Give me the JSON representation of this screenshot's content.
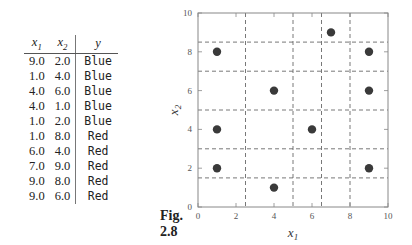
{
  "table": {
    "headers": [
      {
        "base": "x",
        "sub": "1"
      },
      {
        "base": "x",
        "sub": "2"
      },
      {
        "base": "y",
        "sub": ""
      }
    ],
    "rows": [
      [
        "9.0",
        "2.0",
        "Blue"
      ],
      [
        "1.0",
        "4.0",
        "Blue"
      ],
      [
        "4.0",
        "6.0",
        "Blue"
      ],
      [
        "4.0",
        "1.0",
        "Blue"
      ],
      [
        "1.0",
        "2.0",
        "Blue"
      ],
      [
        "1.0",
        "8.0",
        "Red"
      ],
      [
        "6.0",
        "4.0",
        "Red"
      ],
      [
        "7.0",
        "9.0",
        "Red"
      ],
      [
        "9.0",
        "8.0",
        "Red"
      ],
      [
        "9.0",
        "6.0",
        "Red"
      ]
    ]
  },
  "figure": {
    "label_line1": "Fig.",
    "label_line2": "2.8"
  },
  "chart_data": {
    "type": "scatter",
    "title": "",
    "xlabel": "x1",
    "ylabel": "x2",
    "xlim": [
      0,
      10
    ],
    "ylim": [
      0,
      10
    ],
    "x_ticks": [
      0,
      2,
      4,
      6,
      8,
      10
    ],
    "y_ticks": [
      0,
      2,
      4,
      6,
      8,
      10
    ],
    "points": [
      {
        "x": 9,
        "y": 2,
        "class": "Blue"
      },
      {
        "x": 1,
        "y": 4,
        "class": "Blue"
      },
      {
        "x": 4,
        "y": 6,
        "class": "Blue"
      },
      {
        "x": 4,
        "y": 1,
        "class": "Blue"
      },
      {
        "x": 1,
        "y": 2,
        "class": "Blue"
      },
      {
        "x": 1,
        "y": 8,
        "class": "Red"
      },
      {
        "x": 6,
        "y": 4,
        "class": "Red"
      },
      {
        "x": 7,
        "y": 9,
        "class": "Red"
      },
      {
        "x": 9,
        "y": 8,
        "class": "Red"
      },
      {
        "x": 9,
        "y": 6,
        "class": "Red"
      }
    ],
    "vertical_dashed_lines_x": [
      2.5,
      5.0,
      6.5,
      8.0
    ],
    "horizontal_dashed_lines_y": [
      1.5,
      3.0,
      5.0,
      7.0,
      8.5
    ],
    "point_color": "#3a3a3a",
    "grid": false
  }
}
